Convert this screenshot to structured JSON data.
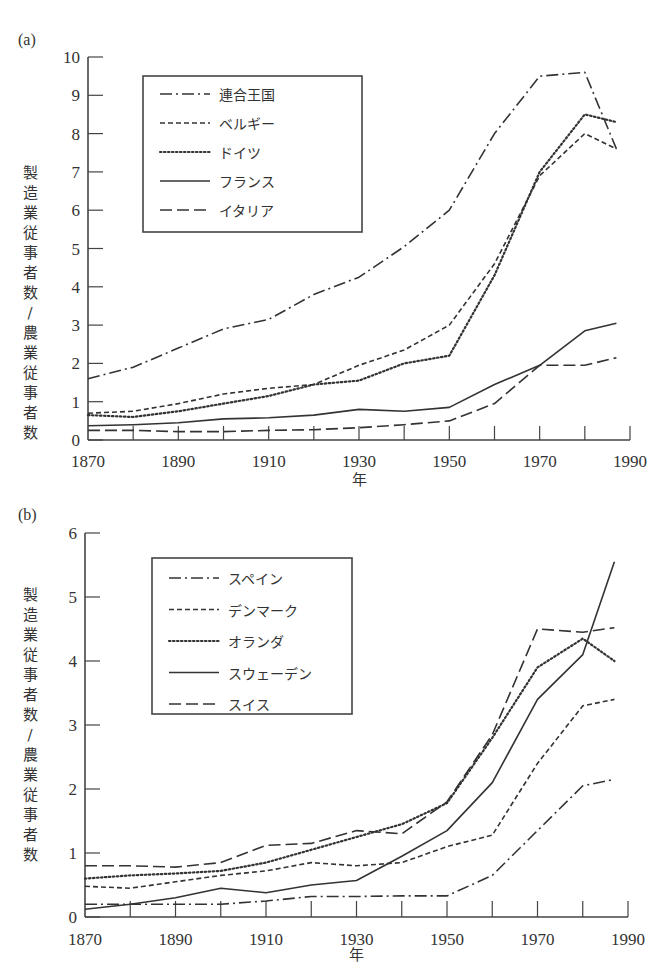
{
  "chart_data": [
    {
      "panel_label": "(a)",
      "type": "line",
      "title": "",
      "xlabel": "年",
      "ylabel": "製造業従事者数／農業従事者数",
      "xlim": [
        1870,
        1990
      ],
      "ylim": [
        0,
        10
      ],
      "xticks": [
        1870,
        1890,
        1910,
        1930,
        1950,
        1970,
        1990
      ],
      "xtick_labels": [
        "1870",
        "1890",
        "1910",
        "1930",
        "1950",
        "1970",
        "1990"
      ],
      "minor_xticks": [
        1880,
        1900,
        1920,
        1940,
        1960,
        1980
      ],
      "yticks": [
        0,
        1,
        2,
        3,
        4,
        5,
        6,
        7,
        8,
        9,
        10
      ],
      "grid": false,
      "legend_position": "upper-left",
      "series": [
        {
          "name": "連合王国",
          "style": "dashdot",
          "x": [
            1870,
            1880,
            1890,
            1900,
            1910,
            1920,
            1930,
            1940,
            1950,
            1960,
            1970,
            1980,
            1987
          ],
          "y": [
            1.6,
            1.9,
            2.4,
            2.9,
            3.15,
            3.8,
            4.25,
            5.05,
            6.0,
            8.0,
            9.5,
            9.6,
            7.6
          ]
        },
        {
          "name": "ベルギー",
          "style": "dashed-short",
          "x": [
            1870,
            1880,
            1890,
            1900,
            1910,
            1920,
            1930,
            1940,
            1950,
            1960,
            1970,
            1980,
            1987
          ],
          "y": [
            0.7,
            0.75,
            0.95,
            1.2,
            1.35,
            1.45,
            1.95,
            2.35,
            3.0,
            4.6,
            6.9,
            8.0,
            7.6
          ]
        },
        {
          "name": "ドイツ",
          "style": "dotted",
          "x": [
            1870,
            1880,
            1890,
            1900,
            1910,
            1920,
            1930,
            1940,
            1950,
            1960,
            1970,
            1980,
            1987
          ],
          "y": [
            0.65,
            0.6,
            0.75,
            0.95,
            1.15,
            1.45,
            1.55,
            2.0,
            2.2,
            4.3,
            7.0,
            8.5,
            8.3
          ]
        },
        {
          "name": "フランス",
          "style": "solid",
          "x": [
            1870,
            1880,
            1890,
            1900,
            1910,
            1920,
            1930,
            1940,
            1950,
            1960,
            1970,
            1980,
            1987
          ],
          "y": [
            0.37,
            0.4,
            0.45,
            0.55,
            0.58,
            0.65,
            0.8,
            0.75,
            0.85,
            1.45,
            1.95,
            2.85,
            3.05
          ]
        },
        {
          "name": "イタリア",
          "style": "dashed-long",
          "x": [
            1870,
            1880,
            1890,
            1900,
            1910,
            1920,
            1930,
            1940,
            1950,
            1960,
            1970,
            1980,
            1987
          ],
          "y": [
            0.25,
            0.25,
            0.22,
            0.22,
            0.25,
            0.27,
            0.32,
            0.4,
            0.5,
            0.95,
            1.95,
            1.95,
            2.15
          ]
        }
      ]
    },
    {
      "panel_label": "(b)",
      "type": "line",
      "title": "",
      "xlabel": "年",
      "ylabel": "製造業従事者数／農業従事者数",
      "xlim": [
        1870,
        1990
      ],
      "ylim": [
        0,
        6
      ],
      "xticks": [
        1870,
        1890,
        1910,
        1930,
        1950,
        1970,
        1990
      ],
      "xtick_labels": [
        "1870",
        "1890",
        "1910",
        "1930",
        "1950",
        "1970",
        "1990"
      ],
      "minor_xticks": [
        1880,
        1900,
        1920,
        1940,
        1960,
        1980
      ],
      "yticks": [
        0,
        1,
        2,
        3,
        4,
        5,
        6
      ],
      "grid": false,
      "legend_position": "upper-left",
      "series": [
        {
          "name": "スペイン",
          "style": "dashdot",
          "x": [
            1870,
            1880,
            1890,
            1900,
            1910,
            1920,
            1930,
            1940,
            1950,
            1960,
            1970,
            1980,
            1987
          ],
          "y": [
            0.2,
            0.2,
            0.2,
            0.2,
            0.25,
            0.32,
            0.32,
            0.33,
            0.33,
            0.65,
            1.35,
            2.05,
            2.15
          ]
        },
        {
          "name": "デンマーク",
          "style": "dashed-short",
          "x": [
            1870,
            1880,
            1890,
            1900,
            1910,
            1920,
            1930,
            1940,
            1950,
            1960,
            1970,
            1980,
            1987
          ],
          "y": [
            0.48,
            0.45,
            0.55,
            0.65,
            0.72,
            0.85,
            0.8,
            0.85,
            1.1,
            1.28,
            2.4,
            3.3,
            3.4
          ]
        },
        {
          "name": "オランダ",
          "style": "dotted",
          "x": [
            1870,
            1880,
            1890,
            1900,
            1910,
            1920,
            1930,
            1940,
            1950,
            1960,
            1970,
            1980,
            1987
          ],
          "y": [
            0.6,
            0.65,
            0.68,
            0.72,
            0.85,
            1.05,
            1.25,
            1.45,
            1.78,
            2.8,
            3.9,
            4.35,
            4.0
          ]
        },
        {
          "name": "スウェーデン",
          "style": "solid",
          "x": [
            1870,
            1880,
            1890,
            1900,
            1910,
            1920,
            1930,
            1940,
            1950,
            1960,
            1970,
            1980,
            1987
          ],
          "y": [
            0.12,
            0.2,
            0.3,
            0.45,
            0.38,
            0.5,
            0.57,
            0.95,
            1.35,
            2.1,
            3.4,
            4.1,
            5.55
          ]
        },
        {
          "name": "スイス",
          "style": "dashed-long",
          "x": [
            1870,
            1880,
            1890,
            1900,
            1910,
            1920,
            1930,
            1940,
            1950,
            1960,
            1970,
            1980,
            1987
          ],
          "y": [
            0.8,
            0.8,
            0.78,
            0.85,
            1.12,
            1.15,
            1.35,
            1.3,
            1.8,
            2.85,
            4.5,
            4.45,
            4.52
          ]
        }
      ]
    }
  ],
  "panels": [
    {
      "label": "(a)",
      "xlabel": "年",
      "ylabel": "製造業従事者数／農業従事者数"
    },
    {
      "label": "(b)",
      "xlabel": "年",
      "ylabel": "製造業従事者数／農業従事者数"
    }
  ],
  "colors": {
    "line": "#333333",
    "axis": "#444444",
    "background": "#ffffff"
  }
}
